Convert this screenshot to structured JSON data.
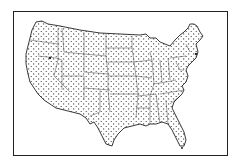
{
  "map": {
    "title": "United States dot map",
    "region": "Contiguous United States",
    "style": "black-and-white dot distribution map with state boundaries",
    "colors": {
      "ink": "#222222",
      "background": "#ffffff"
    }
  }
}
